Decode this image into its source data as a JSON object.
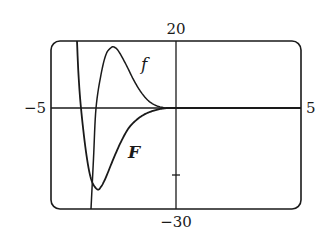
{
  "chart_data": {
    "type": "line",
    "title": "",
    "xlabel": "",
    "ylabel": "",
    "xlim": [
      -5,
      5
    ],
    "ylim": [
      -30,
      20
    ],
    "grid": false,
    "legend": "none (inline curve labels)",
    "tick_labels": {
      "x_min": "−5",
      "x_max": "5",
      "y_max": "20",
      "y_min": "−30"
    },
    "y_ticks_marked": [
      -20
    ],
    "series": [
      {
        "name": "f",
        "label_text": "f",
        "description": "rises steeply from bottom, peaks then decays to 0",
        "x": [
          -3.4,
          -3.3,
          -3.2,
          -3.0,
          -2.8,
          -2.6,
          -2.48,
          -2.3,
          -2.0,
          -1.7,
          -1.4,
          -1.1,
          -0.8,
          -0.5,
          -0.4,
          0,
          1,
          2,
          3,
          4,
          5
        ],
        "y": [
          -30,
          -15,
          0,
          10,
          16,
          18,
          18.2,
          17,
          13,
          8.5,
          4.8,
          2.2,
          0.8,
          0.15,
          0,
          0,
          0,
          0,
          0,
          0,
          0
        ]
      },
      {
        "name": "F",
        "label_text": "F",
        "description": "drops steeply from top, reaches minimum then rises to 0",
        "x": [
          -3.96,
          -3.9,
          -3.8,
          -3.6,
          -3.4,
          -3.16,
          -3.0,
          -2.8,
          -2.5,
          -2.2,
          -1.9,
          -1.6,
          -1.3,
          -1.0,
          -0.7,
          -0.4,
          0,
          1,
          2,
          3,
          4,
          5
        ],
        "y": [
          20,
          10,
          0,
          -13,
          -21,
          -24.1,
          -23.4,
          -20.5,
          -15,
          -10,
          -6,
          -3.6,
          -2.0,
          -1.0,
          -0.35,
          0,
          0,
          0,
          0,
          0,
          0,
          0
        ]
      }
    ],
    "annotations": [
      {
        "text": "f",
        "x": -1.3,
        "y": 13
      },
      {
        "text": "F",
        "x": -1.7,
        "y": -13
      }
    ]
  },
  "labels": {
    "y_max": "20",
    "y_min": "−30",
    "x_min": "−5",
    "x_max": "5",
    "f": "f",
    "F": "F"
  }
}
